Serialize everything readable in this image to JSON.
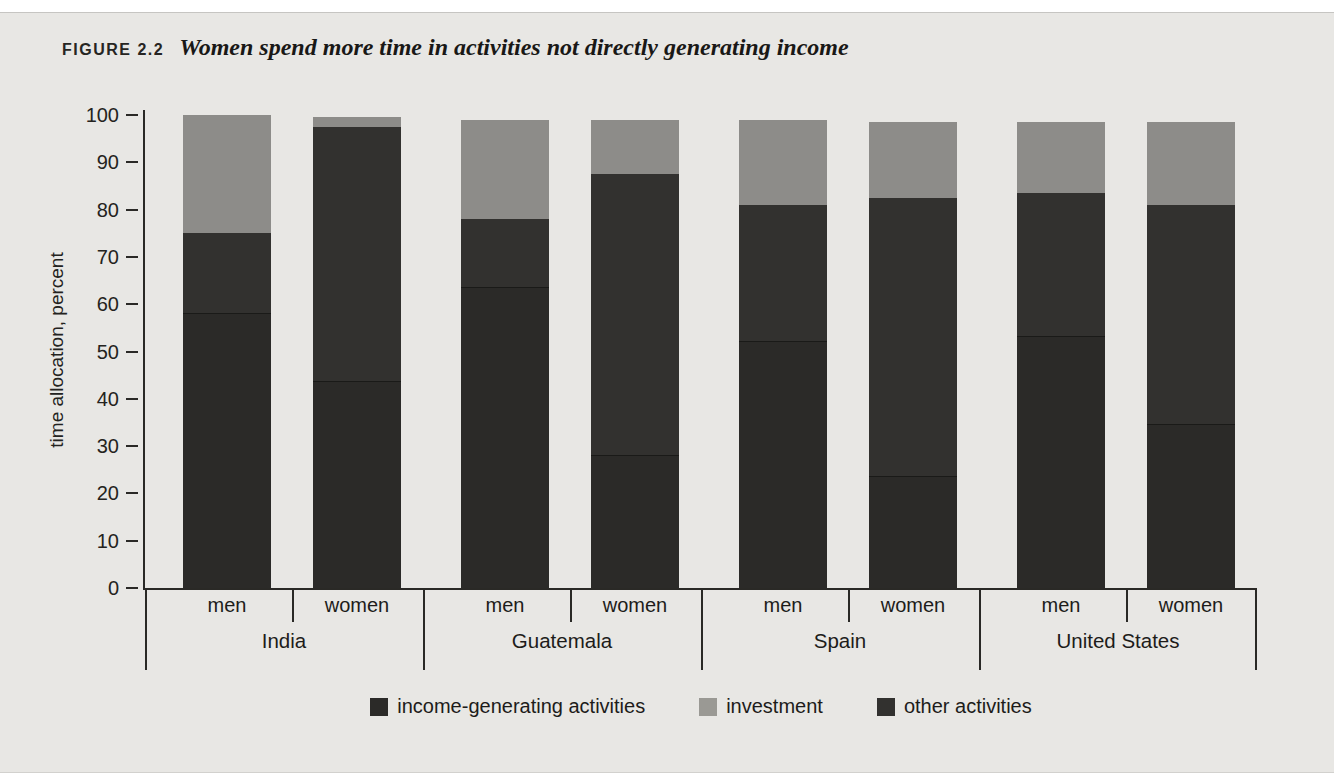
{
  "figure": {
    "label": "FIGURE 2.2",
    "title": "Women spend more time in activities not directly generating income"
  },
  "chart_data": {
    "type": "bar",
    "stacked": true,
    "orientation": "vertical",
    "title": "Women spend more time in activities not directly generating income",
    "ylabel": "time allocation, percent",
    "xlabel": "",
    "ylim": [
      0,
      100
    ],
    "yticks": [
      0,
      10,
      20,
      30,
      40,
      50,
      60,
      70,
      80,
      90,
      100
    ],
    "grid": false,
    "groups": [
      "India",
      "Guatemala",
      "Spain",
      "United States"
    ],
    "bar_labels": [
      "men",
      "women",
      "men",
      "women",
      "men",
      "women",
      "men",
      "women"
    ],
    "stack_order_bottom_to_top": [
      "income-generating activities",
      "other activities",
      "investment"
    ],
    "series": [
      {
        "name": "income-generating activities",
        "color": "#2b2a28",
        "values": [
          58,
          43.5,
          63.5,
          28,
          52,
          23.5,
          53,
          34.5
        ]
      },
      {
        "name": "other activities",
        "color": "#32312f",
        "values": [
          17,
          54,
          14.5,
          59.5,
          29,
          59,
          30.5,
          46.5
        ]
      },
      {
        "name": "investment",
        "color": "#8d8c89",
        "values": [
          25,
          2,
          21,
          11.5,
          18,
          16,
          15,
          17.5
        ]
      }
    ],
    "legend": {
      "position": "bottom",
      "entries": [
        {
          "label": "income-generating activities",
          "color": "#2b2a28"
        },
        {
          "label": "investment",
          "color": "#9a9994"
        },
        {
          "label": "other activities",
          "color": "#32312f"
        }
      ]
    }
  }
}
